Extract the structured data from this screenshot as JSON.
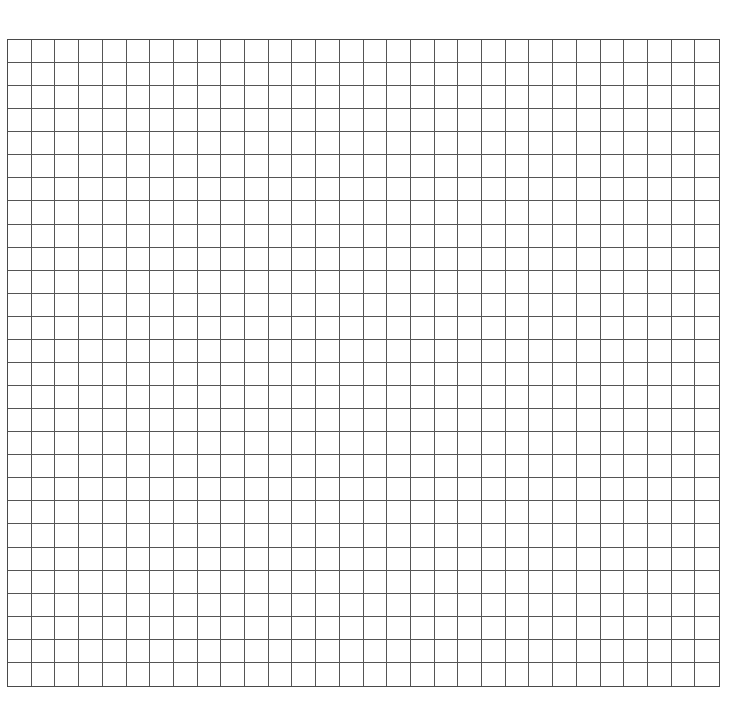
{
  "grid": {
    "columns": 30,
    "rows": 28,
    "line_color": "#555555",
    "background_color": "#ffffff"
  }
}
